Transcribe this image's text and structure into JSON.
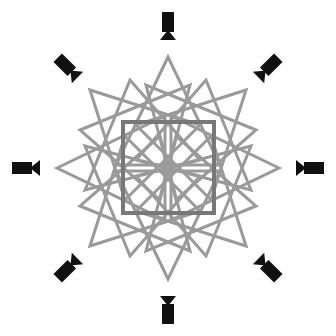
{
  "figure": {
    "colors": {
      "background": "#ffffff",
      "star_lines": "#9a9a9a",
      "center_square": "#787878",
      "camera": "#111111"
    },
    "center": [
      168,
      168
    ],
    "center_square": {
      "x": 123,
      "y": 122,
      "size": 91
    },
    "cameras": [
      {
        "name": "camera-north",
        "angle": 0
      },
      {
        "name": "camera-northeast",
        "angle": 45
      },
      {
        "name": "camera-east",
        "angle": 90
      },
      {
        "name": "camera-southeast",
        "angle": 135
      },
      {
        "name": "camera-south",
        "angle": 180
      },
      {
        "name": "camera-southwest",
        "angle": 225
      },
      {
        "name": "camera-west",
        "angle": 270
      },
      {
        "name": "camera-northwest",
        "angle": 315
      }
    ],
    "camera_radius": 140
  }
}
